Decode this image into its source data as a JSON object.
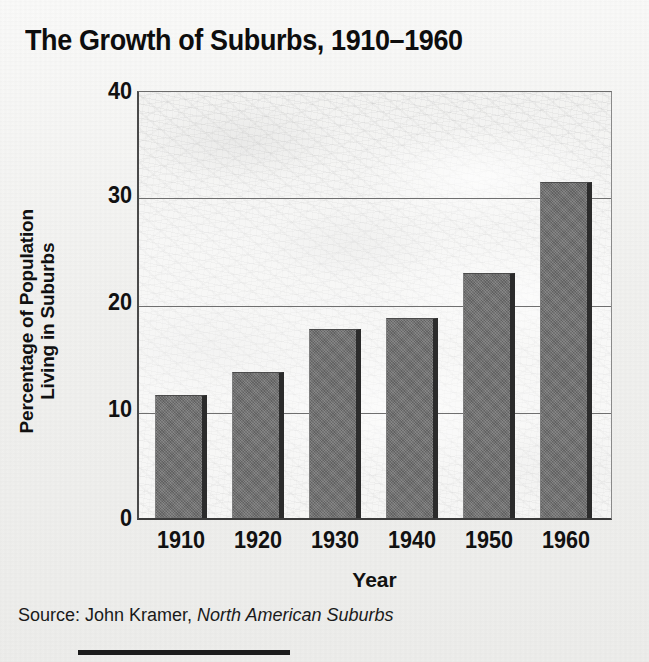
{
  "chart_data": {
    "type": "bar",
    "title": "The Growth of Suburbs, 1910–1960",
    "xlabel": "Year",
    "ylabel": "Percentage of Population Living in Suburbs",
    "ylabel_lines": [
      "Percentage of Population",
      "Living in Suburbs"
    ],
    "categories": [
      "1910",
      "1920",
      "1930",
      "1940",
      "1950",
      "1960"
    ],
    "values": [
      11.7,
      13.8,
      17.8,
      18.8,
      23.0,
      31.5
    ],
    "ylim": [
      0,
      40
    ],
    "yticks": [
      "0",
      "10",
      "20",
      "30",
      "40"
    ],
    "ytick_values": [
      0,
      10,
      20,
      30,
      40
    ],
    "grid": true,
    "legend": "none",
    "bar_color": "#6d6d6d",
    "bar_shadow_color": "#2b2b2b",
    "gridline_color": "#6f6f6f",
    "text_color": "#111111",
    "background_note": "faint aerial photograph of a suburban development behind the plot area"
  },
  "source": {
    "prefix": "Source: John Kramer, ",
    "publication": "North American Suburbs"
  }
}
